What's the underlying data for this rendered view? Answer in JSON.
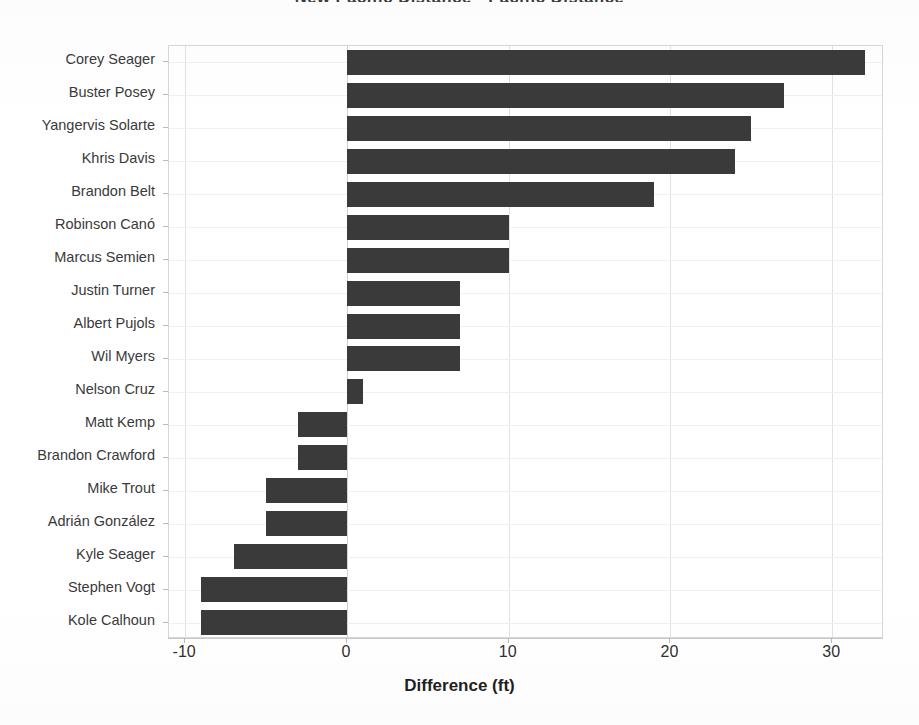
{
  "chart_data": {
    "type": "bar",
    "orientation": "horizontal",
    "title": "New Pacific Distance - Pacific Distance",
    "xlabel": "Difference (ft)",
    "ylabel": "",
    "xlim": [
      -11.0,
      33.2
    ],
    "xticks": [
      -10,
      0,
      10,
      20,
      30
    ],
    "xtick_labels": [
      "-10",
      "0",
      "10",
      "20",
      "30"
    ],
    "grid": "vertical gridlines at x ticks, faint horizontal category lines",
    "legend": "none",
    "bar_color": "#3a3a3a",
    "categories": [
      "Corey Seager",
      "Buster Posey",
      "Yangervis Solarte",
      "Khris Davis",
      "Brandon Belt",
      "Robinson Canó",
      "Marcus Semien",
      "Justin Turner",
      "Albert Pujols",
      "Wil Myers",
      "Nelson Cruz",
      "Matt Kemp",
      "Brandon Crawford",
      "Mike Trout",
      "Adrián González",
      "Kyle Seager",
      "Stephen Vogt",
      "Kole Calhoun"
    ],
    "values": [
      32,
      27,
      25,
      24,
      19,
      10,
      10,
      7,
      7,
      7,
      1,
      -3,
      -3,
      -5,
      -5,
      -7,
      -9,
      -9
    ]
  }
}
